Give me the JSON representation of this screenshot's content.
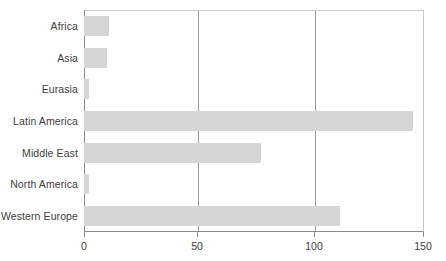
{
  "chart_data": {
    "type": "bar",
    "orientation": "horizontal",
    "title": "",
    "subtitle": "",
    "xlabel": "",
    "ylabel": "",
    "categories": [
      "Africa",
      "Asia",
      "Eurasia",
      "Latin America",
      "Middle East",
      "North America",
      "Western Europe"
    ],
    "values": [
      11,
      10,
      2,
      145,
      78,
      2,
      113
    ],
    "xlim": [
      0,
      150
    ],
    "xticks": [
      0,
      50,
      100,
      150
    ],
    "xtick_labels": [
      "0",
      "50",
      "100",
      "150"
    ],
    "grid": "vertical",
    "gridlines_at": [
      50,
      100
    ],
    "legend": "none",
    "bar_color": "#d6d6d6",
    "axis_color": "#8c8c8c",
    "gridline_color": "#9a9a9a",
    "text_color": "#3d3d3d",
    "background_color": "#ffffff"
  }
}
